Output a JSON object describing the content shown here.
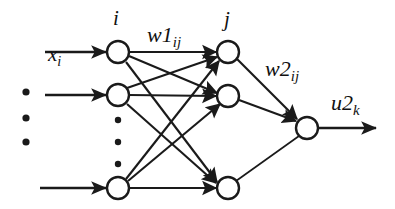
{
  "figure": {
    "background_color": "#ffffff",
    "stroke_color": "#1a1a1a",
    "node_fill": "#ffffff",
    "width": 395,
    "height": 209
  },
  "labels": {
    "input_label": {
      "base": "x",
      "sub": "i",
      "name": "input-vector-label"
    },
    "input_layer_index": {
      "base": "i",
      "sub": "",
      "name": "input-layer-index-label"
    },
    "weight1": {
      "base": "w1",
      "sub": "ij",
      "name": "weight-layer1-label"
    },
    "hidden_layer_index": {
      "base": "j",
      "sub": "",
      "name": "hidden-layer-index-label"
    },
    "weight2": {
      "base": "w2",
      "sub": "ij",
      "name": "weight-layer2-label"
    },
    "output_label": {
      "base": "u2",
      "sub": "k",
      "name": "output-label"
    }
  },
  "layers": [
    {
      "id": "input-layer",
      "name": "Input layer",
      "index_symbol": "i",
      "nodes": [
        {
          "id": "input-node-1",
          "cx": 118,
          "cy": 52,
          "r": 11
        },
        {
          "id": "input-node-2",
          "cx": 118,
          "cy": 95,
          "r": 11
        },
        {
          "id": "input-node-n",
          "cx": 118,
          "cy": 188,
          "r": 11
        }
      ],
      "ellipsis_dots": [
        {
          "cx": 118,
          "cy": 120,
          "r": 3
        },
        {
          "cx": 118,
          "cy": 142,
          "r": 3
        },
        {
          "cx": 118,
          "cy": 164,
          "r": 3
        }
      ]
    },
    {
      "id": "hidden-layer",
      "name": "Hidden layer",
      "index_symbol": "j",
      "nodes": [
        {
          "id": "hidden-node-1",
          "cx": 228,
          "cy": 52,
          "r": 11
        },
        {
          "id": "hidden-node-2",
          "cx": 228,
          "cy": 96,
          "r": 11
        },
        {
          "id": "hidden-node-m",
          "cx": 228,
          "cy": 188,
          "r": 11
        }
      ],
      "ellipsis_dots": []
    },
    {
      "id": "output-layer",
      "name": "Output layer",
      "index_symbol": "k",
      "nodes": [
        {
          "id": "output-node-1",
          "cx": 307,
          "cy": 128,
          "r": 11
        }
      ],
      "ellipsis_dots": []
    }
  ],
  "input_ellipsis_dots": [
    {
      "cx": 26,
      "cy": 92,
      "r": 4
    },
    {
      "cx": 26,
      "cy": 118,
      "r": 4
    },
    {
      "cx": 26,
      "cy": 142,
      "r": 4
    }
  ],
  "incoming_arrows": [
    {
      "id": "input-arrow-1",
      "x1": 45,
      "y1": 52,
      "x2": 107,
      "y2": 52
    },
    {
      "id": "input-arrow-2",
      "x1": 45,
      "y1": 95,
      "x2": 107,
      "y2": 95
    },
    {
      "id": "input-arrow-n",
      "x1": 40,
      "y1": 188,
      "x2": 107,
      "y2": 188
    }
  ],
  "outgoing_arrows": [
    {
      "id": "output-arrow-1",
      "x1": 318,
      "y1": 128,
      "x2": 378,
      "y2": 128
    }
  ],
  "connections_layer1": [
    {
      "id": "w1-i1-j1",
      "from": "input-node-1",
      "to": "hidden-node-1"
    },
    {
      "id": "w1-i1-j2",
      "from": "input-node-1",
      "to": "hidden-node-2"
    },
    {
      "id": "w1-i1-jm",
      "from": "input-node-1",
      "to": "hidden-node-m"
    },
    {
      "id": "w1-i2-j1",
      "from": "input-node-2",
      "to": "hidden-node-1"
    },
    {
      "id": "w1-i2-j2",
      "from": "input-node-2",
      "to": "hidden-node-2"
    },
    {
      "id": "w1-i2-jm",
      "from": "input-node-2",
      "to": "hidden-node-m"
    },
    {
      "id": "w1-in-j1",
      "from": "input-node-n",
      "to": "hidden-node-1"
    },
    {
      "id": "w1-in-j2",
      "from": "input-node-n",
      "to": "hidden-node-2"
    },
    {
      "id": "w1-in-jm",
      "from": "input-node-n",
      "to": "hidden-node-m"
    }
  ],
  "connections_layer2": [
    {
      "id": "w2-j1-k1",
      "from": "hidden-node-1",
      "to": "output-node-1"
    },
    {
      "id": "w2-j2-k1",
      "from": "hidden-node-2",
      "to": "output-node-1"
    },
    {
      "id": "w2-jm-k1",
      "from": "hidden-node-m",
      "to": "output-node-1"
    }
  ]
}
